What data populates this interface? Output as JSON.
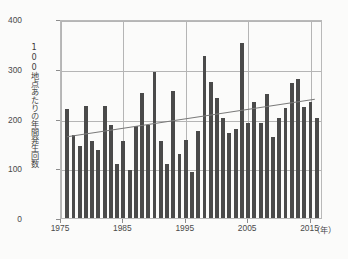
{
  "chart_data": {
    "type": "bar",
    "title": "",
    "subtitle": "",
    "xlabel": "年",
    "ylabel": "100地点あたりの年間発生回数",
    "xlim": [
      1975,
      2017
    ],
    "ylim": [
      0,
      400
    ],
    "yticks": [
      0,
      100,
      200,
      300,
      400
    ],
    "ytick_labels": [
      "0",
      "100",
      "200",
      "300",
      "400"
    ],
    "xticks": [
      1975,
      1985,
      1995,
      2005,
      2015
    ],
    "xtick_labels": [
      "1975",
      "1985",
      "1995",
      "2005",
      "2015"
    ],
    "grid": "horizontal-and-vertical",
    "legend": "none",
    "bar_color": "#4a4a4a",
    "grid_color": "#b5b5b5",
    "trend_color": "#7a7a7a",
    "categories": [
      1976,
      1977,
      1978,
      1979,
      1980,
      1981,
      1982,
      1983,
      1984,
      1985,
      1986,
      1987,
      1988,
      1989,
      1990,
      1991,
      1992,
      1993,
      1994,
      1995,
      1996,
      1997,
      1998,
      1999,
      2000,
      2001,
      2002,
      2003,
      2004,
      2005,
      2006,
      2007,
      2008,
      2009,
      2010,
      2011,
      2012,
      2013,
      2014,
      2015,
      2016
    ],
    "values": [
      220,
      166,
      144,
      225,
      154,
      137,
      225,
      186,
      109,
      154,
      97,
      184,
      251,
      186,
      294,
      154,
      109,
      255,
      129,
      157,
      93,
      174,
      326,
      274,
      242,
      201,
      170,
      178,
      351,
      190,
      233,
      190,
      250,
      163,
      202,
      222,
      271,
      280,
      223,
      233,
      201
    ],
    "series": [
      {
        "name": "100地点あたりの年間発生回数",
        "values": [
          220,
          166,
          144,
          225,
          154,
          137,
          225,
          186,
          109,
          154,
          97,
          184,
          251,
          186,
          294,
          154,
          109,
          255,
          129,
          157,
          93,
          174,
          326,
          274,
          242,
          201,
          170,
          178,
          351,
          190,
          233,
          190,
          250,
          163,
          202,
          222,
          271,
          280,
          223,
          233,
          201
        ]
      }
    ],
    "trendline": {
      "type": "linear",
      "x_start": 1976,
      "x_end": 2016,
      "y_start": 165,
      "y_end": 241
    },
    "annotations": []
  },
  "axis": {
    "unit_note": "（年）"
  }
}
